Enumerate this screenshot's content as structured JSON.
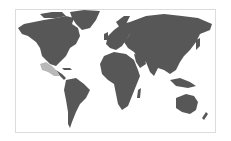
{
  "map": {
    "type": "world-locator-map",
    "highlighted_region": "Mexico",
    "colors": {
      "land": "#575757",
      "highlight": "#b8b8b8",
      "water": "#ffffff",
      "border": "#dcdcdc"
    }
  }
}
